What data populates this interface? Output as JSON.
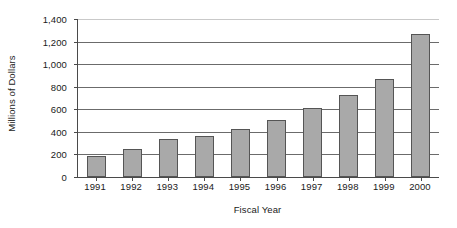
{
  "chart_data": {
    "type": "bar",
    "title": "",
    "subtitle": "",
    "xlabel": "Fiscal Year",
    "ylabel": "Millions of Dollars",
    "categories": [
      "1991",
      "1992",
      "1993",
      "1994",
      "1995",
      "1996",
      "1997",
      "1998",
      "1999",
      "2000"
    ],
    "values": [
      185,
      245,
      335,
      365,
      425,
      505,
      615,
      730,
      870,
      1265
    ],
    "series": [
      {
        "name": "Millions of Dollars",
        "values": [
          185,
          245,
          335,
          365,
          425,
          505,
          615,
          730,
          870,
          1265
        ]
      }
    ],
    "ylim": [
      0,
      1400
    ],
    "ytick_values": [
      0,
      200,
      400,
      600,
      800,
      1000,
      1200,
      1400
    ],
    "ytick_labels": [
      "0",
      "200",
      "400",
      "600",
      "800",
      "1,000",
      "1,200",
      "1,400"
    ],
    "xlim": [
      0,
      10
    ],
    "grid": true,
    "grid_axis": "y",
    "legend": false,
    "legend_position": "none",
    "annotations": [],
    "bar_color": "#a9a9a9",
    "bar_edge_color": "#555555",
    "axis_color": "#4a4a4a",
    "gridline_color": "#6b6b6b",
    "text_color": "#1a1a1a",
    "background_color": "#ffffff"
  },
  "axes": {
    "y_title": "Millions of Dollars",
    "x_title": "Fiscal Year"
  }
}
